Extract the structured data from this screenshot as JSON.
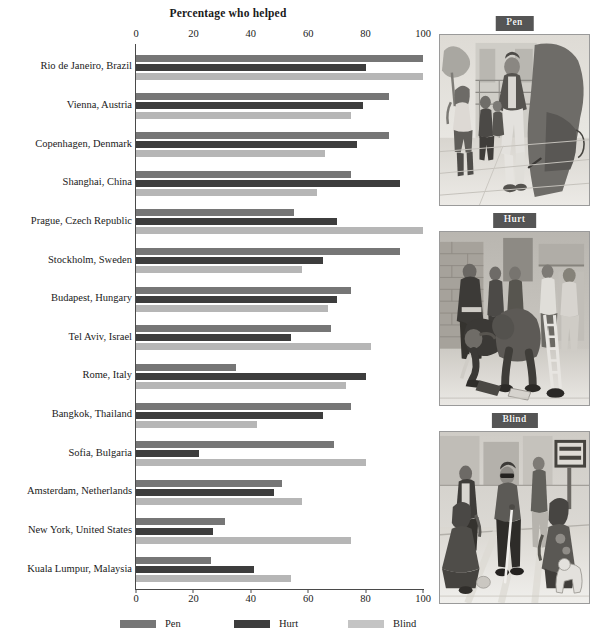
{
  "chart_data": {
    "type": "bar",
    "orientation": "horizontal",
    "title": "Percentage who helped",
    "xlabel": "",
    "ylabel": "",
    "xlim": [
      0,
      100
    ],
    "xticks": [
      0,
      20,
      40,
      60,
      80,
      100
    ],
    "grid": false,
    "legend_position": "bottom",
    "categories": [
      "Rio de Janeiro, Brazil",
      "Vienna, Austria",
      "Copenhagen, Denmark",
      "Shanghai, China",
      "Prague, Czech Republic",
      "Stockholm, Sweden",
      "Budapest, Hungary",
      "Tel Aviv, Israel",
      "Rome, Italy",
      "Bangkok, Thailand",
      "Sofia, Bulgaria",
      "Amsterdam, Netherlands",
      "New York, United States",
      "Kuala Lumpur, Malaysia"
    ],
    "series": [
      {
        "name": "Pen",
        "color": "#767676",
        "values": [
          100,
          88,
          88,
          75,
          55,
          92,
          75,
          68,
          35,
          75,
          69,
          51,
          31,
          26
        ]
      },
      {
        "name": "Hurt",
        "color": "#3d3d3d",
        "values": [
          80,
          79,
          77,
          92,
          70,
          65,
          70,
          54,
          80,
          65,
          22,
          48,
          27,
          41
        ]
      },
      {
        "name": "Blind",
        "color": "#b6b6b6",
        "values": [
          100,
          75,
          66,
          63,
          100,
          58,
          67,
          82,
          73,
          42,
          80,
          58,
          75,
          54
        ]
      }
    ]
  },
  "legend": {
    "items": [
      {
        "label": "Pen",
        "swatch": "pen"
      },
      {
        "label": "Hurt",
        "swatch": "hurt"
      },
      {
        "label": "Blind",
        "swatch": "blind"
      }
    ]
  },
  "panels": [
    {
      "tag": "Pen",
      "caption": "Pencil-sketch street scene: a man walking past a dropped pen on the pavement with pedestrians nearby"
    },
    {
      "tag": "Hurt",
      "caption": "Pencil-sketch street scene: a person with a leg brace bending to pick up dropped magazines while bystanders pass"
    },
    {
      "tag": "Blind",
      "caption": "Pencil-sketch street scene: a blind man with a white cane at a crosswalk beside a DON'T WALK sign"
    }
  ],
  "colors": {
    "pen": "#767676",
    "hurt": "#3d3d3d",
    "blind": "#b6b6b6",
    "axis": "#4a4a4a",
    "text": "#1a1a1a",
    "tag_background": "#555555"
  }
}
